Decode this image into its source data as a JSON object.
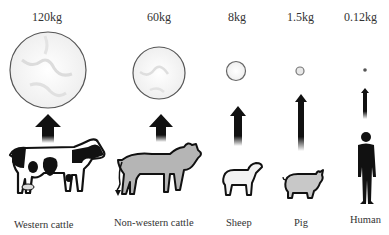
{
  "title_cropped": "",
  "columns": [
    {
      "animal": "Western cattle",
      "amount": "120kg"
    },
    {
      "animal": "Non-western cattle",
      "amount": "60kg"
    },
    {
      "animal": "Sheep",
      "amount": "8kg"
    },
    {
      "animal": "Pig",
      "amount": "1.5kg"
    },
    {
      "animal": "Human",
      "amount": "0.12kg"
    }
  ],
  "colors": {
    "circle_stroke": "#555555",
    "circle_fill": "#f4f4f4",
    "marble": "#d9d9d9",
    "arrow": "#111111",
    "cattle_gray": "#b5b5b5",
    "pig_gray": "#c8c8c8",
    "silhouette": "#111111"
  }
}
